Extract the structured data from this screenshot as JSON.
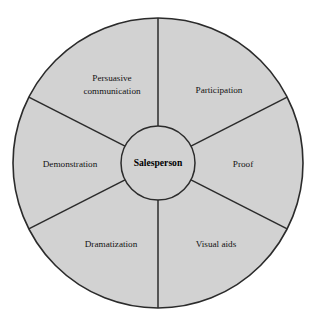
{
  "diagram": {
    "type": "radial-wheel",
    "hub": {
      "label": "Salesperson"
    },
    "geometry": {
      "center_x": 158,
      "center_y": 163,
      "outer_radius": 145,
      "inner_radius": 37,
      "spoke_angles_deg": [
        90,
        27,
        -27,
        270,
        207,
        153
      ]
    },
    "colors": {
      "sector_fill": "#d2d2d2",
      "hub_fill": "#d2d2d2",
      "stroke": "#2b2b2b",
      "background": "#ffffff",
      "text": "#121212"
    },
    "sectors": [
      {
        "id": "persuasive-communication",
        "label_line1": "Persuasive",
        "label_line2": "communication",
        "label": "Persuasive communication",
        "start_angle_deg": 90,
        "end_angle_deg": 153,
        "label_x": 112,
        "label_y": 86
      },
      {
        "id": "participation",
        "label_line1": "Participation",
        "label_line2": "",
        "label": "Participation",
        "start_angle_deg": 27,
        "end_angle_deg": 90,
        "label_x": 219,
        "label_y": 91
      },
      {
        "id": "proof",
        "label_line1": "Proof",
        "label_line2": "",
        "label": "Proof",
        "start_angle_deg": -27,
        "end_angle_deg": 27,
        "label_x": 243,
        "label_y": 165
      },
      {
        "id": "visual-aids",
        "label_line1": "Visual aids",
        "label_line2": "",
        "label": "Visual aids",
        "start_angle_deg": 270,
        "end_angle_deg": 333,
        "label_x": 216,
        "label_y": 245
      },
      {
        "id": "dramatization",
        "label_line1": "Dramatization",
        "label_line2": "",
        "label": "Dramatization",
        "start_angle_deg": 207,
        "end_angle_deg": 270,
        "label_x": 111,
        "label_y": 245
      },
      {
        "id": "demonstration",
        "label_line1": "Demonstration",
        "label_line2": "",
        "label": "Demonstration",
        "start_angle_deg": 153,
        "end_angle_deg": 207,
        "label_x": 70,
        "label_y": 165
      }
    ]
  }
}
